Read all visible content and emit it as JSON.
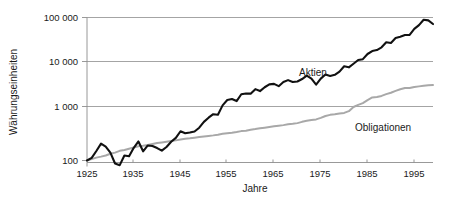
{
  "chart_data": {
    "type": "line",
    "title": "",
    "subtitle": "",
    "xlabel": "Jahre",
    "ylabel": "Währungseinheiten",
    "yscale": "log",
    "ylim": [
      100,
      100000
    ],
    "xlim": [
      1925,
      1999
    ],
    "grid": true,
    "grid_axis": "y",
    "legend_position": "inline-annotation",
    "y_ticks": [
      100,
      1000,
      10000,
      100000
    ],
    "y_tick_labels": [
      "100",
      "1 000",
      "10 000",
      "100 000"
    ],
    "x_ticks": [
      1925,
      1935,
      1945,
      1955,
      1965,
      1975,
      1985,
      1995
    ],
    "x_tick_labels": [
      "1925",
      "1935",
      "1945",
      "1955",
      "1965",
      "1975",
      "1985",
      "1995"
    ],
    "annotations": [
      {
        "text": "Aktien",
        "x": 1964,
        "y": 4200,
        "series": "Aktien"
      },
      {
        "text": "Obligationen",
        "x": 1983,
        "y": 560,
        "series": "Obligationen"
      }
    ],
    "series": [
      {
        "name": "Aktien",
        "color": "#111111",
        "x": [
          1925,
          1926,
          1927,
          1928,
          1929,
          1930,
          1931,
          1932,
          1933,
          1934,
          1935,
          1936,
          1937,
          1938,
          1939,
          1940,
          1941,
          1942,
          1943,
          1944,
          1945,
          1946,
          1947,
          1948,
          1949,
          1950,
          1951,
          1952,
          1953,
          1954,
          1955,
          1956,
          1957,
          1958,
          1959,
          1960,
          1961,
          1962,
          1963,
          1964,
          1965,
          1966,
          1967,
          1968,
          1969,
          1970,
          1971,
          1972,
          1973,
          1974,
          1975,
          1976,
          1977,
          1978,
          1979,
          1980,
          1981,
          1982,
          1983,
          1984,
          1985,
          1986,
          1987,
          1988,
          1989,
          1990,
          1991,
          1992,
          1993,
          1994,
          1995,
          1996,
          1997,
          1998,
          1999
        ],
        "values": [
          100,
          112,
          150,
          205,
          180,
          140,
          88,
          82,
          124,
          120,
          172,
          225,
          148,
          190,
          186,
          170,
          152,
          178,
          222,
          262,
          348,
          320,
          330,
          345,
          405,
          520,
          620,
          720,
          705,
          1060,
          1390,
          1470,
          1320,
          1870,
          1950,
          1930,
          2430,
          2200,
          2680,
          3100,
          3180,
          2830,
          3490,
          3860,
          3490,
          3600,
          4080,
          4830,
          4150,
          3060,
          4170,
          5130,
          4780,
          5050,
          5950,
          7820,
          7420,
          8920,
          10800,
          11300,
          14800,
          17300,
          18200,
          21000,
          27400,
          26400,
          34100,
          36500,
          39900,
          40200,
          55000,
          67000,
          89000,
          86000,
          71000
        ]
      },
      {
        "name": "Obligationen",
        "color": "#a8a8a8",
        "x": [
          1925,
          1926,
          1927,
          1928,
          1929,
          1930,
          1931,
          1932,
          1933,
          1934,
          1935,
          1936,
          1937,
          1938,
          1939,
          1940,
          1941,
          1942,
          1943,
          1944,
          1945,
          1946,
          1947,
          1948,
          1949,
          1950,
          1951,
          1952,
          1953,
          1954,
          1955,
          1956,
          1957,
          1958,
          1959,
          1960,
          1961,
          1962,
          1963,
          1964,
          1965,
          1966,
          1967,
          1968,
          1969,
          1970,
          1971,
          1972,
          1973,
          1974,
          1975,
          1976,
          1977,
          1978,
          1979,
          1980,
          1981,
          1982,
          1983,
          1984,
          1985,
          1986,
          1987,
          1988,
          1989,
          1990,
          1991,
          1992,
          1993,
          1994,
          1995,
          1996,
          1997,
          1998,
          1999
        ],
        "values": [
          100,
          106,
          113,
          118,
          124,
          133,
          140,
          151,
          156,
          165,
          174,
          183,
          188,
          194,
          202,
          210,
          216,
          222,
          229,
          236,
          245,
          252,
          257,
          264,
          272,
          279,
          285,
          292,
          301,
          313,
          321,
          328,
          338,
          350,
          356,
          372,
          382,
          394,
          406,
          419,
          430,
          441,
          452,
          468,
          478,
          492,
          520,
          545,
          561,
          577,
          615,
          668,
          700,
          720,
          745,
          760,
          820,
          980,
          1090,
          1190,
          1390,
          1590,
          1630,
          1720,
          1880,
          2020,
          2230,
          2420,
          2580,
          2580,
          2720,
          2800,
          2890,
          2950,
          2990
        ]
      }
    ]
  },
  "axes": {
    "x_title": "Jahre",
    "y_title": "Währungseinheiten"
  },
  "colors": {
    "aktien": "#111111",
    "obligationen": "#a8a8a8",
    "grid": "#8d8d8d",
    "text": "#1a1a1a",
    "background": "#ffffff"
  }
}
